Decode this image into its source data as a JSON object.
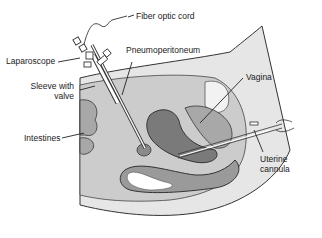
{
  "diagram": {
    "labels": {
      "fiber_optic_cord": "Fiber optic cord",
      "laparoscope": "Laparoscope",
      "pneumoperitoneum": "Pneumoperitoneum",
      "sleeve_line1": "Sleeve with",
      "sleeve_line2": "valve",
      "vagina": "Vagina",
      "intestines": "Intestines",
      "uterine_line1": "Uterine",
      "uterine_line2": "cannula"
    },
    "colors": {
      "skin": "#e4e4e4",
      "cavity": "#cfcfcf",
      "organ_dark": "#7a7a7a",
      "organ_mid": "#a8a8a8",
      "outline": "#333333",
      "white": "#ffffff"
    }
  }
}
